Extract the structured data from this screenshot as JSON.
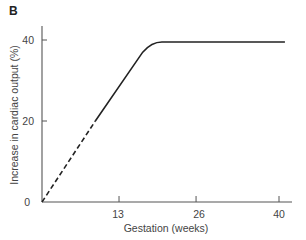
{
  "panel_label": "B",
  "chart_data": {
    "type": "line",
    "title": "",
    "xlabel": "Gestation (weeks)",
    "ylabel": "Increase in cardiac output (%)",
    "xlim": [
      0,
      42
    ],
    "ylim": [
      0,
      42
    ],
    "x_ticks": [
      0,
      13,
      26,
      40
    ],
    "y_ticks": [
      0,
      20,
      40
    ],
    "x_tick_labels": [
      "0",
      "13",
      "26",
      "40"
    ],
    "y_tick_labels": [
      "20",
      "40"
    ],
    "origin_label": "0",
    "grid": false,
    "legend": null,
    "series": [
      {
        "name": "extrapolated",
        "style": "dashed",
        "x": [
          0,
          9
        ],
        "y": [
          0,
          20
        ]
      },
      {
        "name": "measured",
        "style": "solid",
        "x": [
          9,
          13,
          17,
          18.5,
          20,
          26,
          30,
          35,
          41
        ],
        "y": [
          20,
          28.5,
          37,
          38.8,
          39.5,
          39.5,
          39.5,
          39.5,
          39.5
        ]
      }
    ]
  }
}
